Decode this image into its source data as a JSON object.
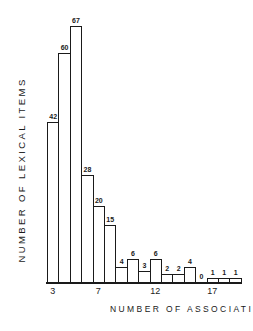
{
  "chart_data": {
    "type": "bar",
    "title": "",
    "xlabel": "NUMBER OF ASSOCIATIONS",
    "ylabel": "NUMBER OF LEXICAL ITEMS",
    "categories": [
      3,
      4,
      5,
      6,
      7,
      8,
      9,
      10,
      11,
      12,
      13,
      14,
      15,
      16,
      17,
      18,
      19
    ],
    "values": [
      42,
      60,
      67,
      28,
      20,
      15,
      4,
      6,
      3,
      6,
      2,
      2,
      4,
      0,
      1,
      1,
      1
    ],
    "x_tick_labels": [
      "3",
      "7",
      "12",
      "17"
    ],
    "x_tick_values": [
      3,
      7,
      12,
      17
    ],
    "data_labels_shown": true,
    "grid": false,
    "legend": null,
    "ylim": [
      0,
      67
    ]
  },
  "labels": {
    "x_axis": "NUMBER OF ASSOCIATIONS",
    "y_axis": "NUMBER OF LEXICAL ITEMS"
  }
}
